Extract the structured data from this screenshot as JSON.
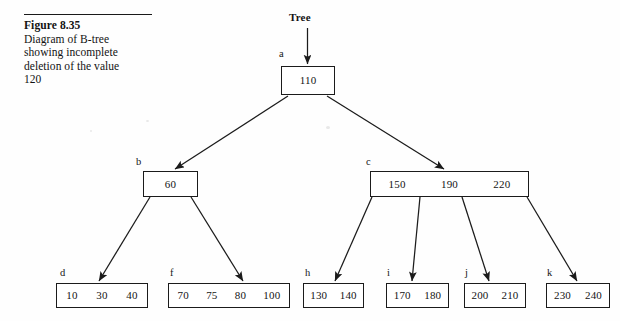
{
  "figure": {
    "number": "Figure 8.35",
    "caption_lines": [
      "Diagram of B-tree",
      "showing incomplete",
      "deletion of the value",
      "120"
    ]
  },
  "diagram": {
    "root_pointer_label": "Tree",
    "nodes": [
      {
        "id": "a",
        "label": "a",
        "keys": [
          "110"
        ]
      },
      {
        "id": "b",
        "label": "b",
        "keys": [
          "60"
        ]
      },
      {
        "id": "c",
        "label": "c",
        "keys": [
          "150",
          "190",
          "220"
        ]
      },
      {
        "id": "d",
        "label": "d",
        "keys": [
          "10",
          "30",
          "40"
        ]
      },
      {
        "id": "f",
        "label": "f",
        "keys": [
          "70",
          "75",
          "80",
          "100"
        ]
      },
      {
        "id": "h",
        "label": "h",
        "keys": [
          "130",
          "140"
        ]
      },
      {
        "id": "i",
        "label": "i",
        "keys": [
          "170",
          "180"
        ]
      },
      {
        "id": "j",
        "label": "j",
        "keys": [
          "200",
          "210"
        ]
      },
      {
        "id": "k",
        "label": "k",
        "keys": [
          "230",
          "240"
        ]
      }
    ],
    "edges": [
      {
        "from": "Tree",
        "to": "a"
      },
      {
        "from": "a",
        "to": "b"
      },
      {
        "from": "a",
        "to": "c"
      },
      {
        "from": "b",
        "to": "d"
      },
      {
        "from": "b",
        "to": "f"
      },
      {
        "from": "c",
        "to": "h"
      },
      {
        "from": "c",
        "to": "i"
      },
      {
        "from": "c",
        "to": "j"
      },
      {
        "from": "c",
        "to": "k"
      }
    ],
    "colors": {
      "ink": "#1b1b1b",
      "page": "#fefefe"
    }
  }
}
